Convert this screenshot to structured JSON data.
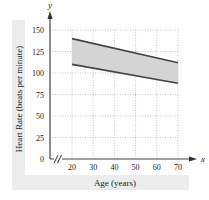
{
  "chart_data": {
    "type": "area",
    "title": "",
    "xlabel": "Age (years)",
    "ylabel": "Heart Rate (beats per minute)",
    "x_axis_letter": "x",
    "y_axis_letter": "y",
    "x_ticks": [
      20,
      30,
      40,
      50,
      60,
      70
    ],
    "y_ticks": [
      0,
      25,
      50,
      75,
      100,
      125,
      150
    ],
    "xlim": [
      20,
      70
    ],
    "ylim": [
      0,
      150
    ],
    "x_axis_break": true,
    "grid": true,
    "grid_style": "dotted",
    "series": [
      {
        "name": "upper bound",
        "x": [
          20,
          70
        ],
        "values": [
          140,
          112
        ]
      },
      {
        "name": "lower bound",
        "x": [
          20,
          70
        ],
        "values": [
          110,
          88
        ]
      }
    ],
    "shaded_region": {
      "between": [
        "lower bound",
        "upper bound"
      ],
      "color": "#d4d4d4"
    },
    "colors": {
      "line": "#444444",
      "fill": "#d4d4d4",
      "grid": "#9a9a9a",
      "label_panel": "#ececec"
    }
  }
}
